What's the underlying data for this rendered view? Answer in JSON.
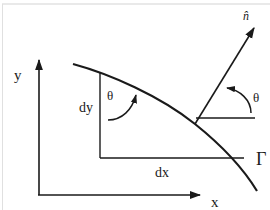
{
  "diagram": {
    "labels": {
      "y_axis": "y",
      "x_axis": "x",
      "dy": "dy",
      "dx": "dx",
      "theta_left": "θ",
      "theta_right": "θ",
      "boundary": "Γ",
      "normal": "n̂"
    },
    "colors": {
      "stroke": "#1a1a1a",
      "frame": "#d0d0d0",
      "background": "#ffffff"
    }
  }
}
